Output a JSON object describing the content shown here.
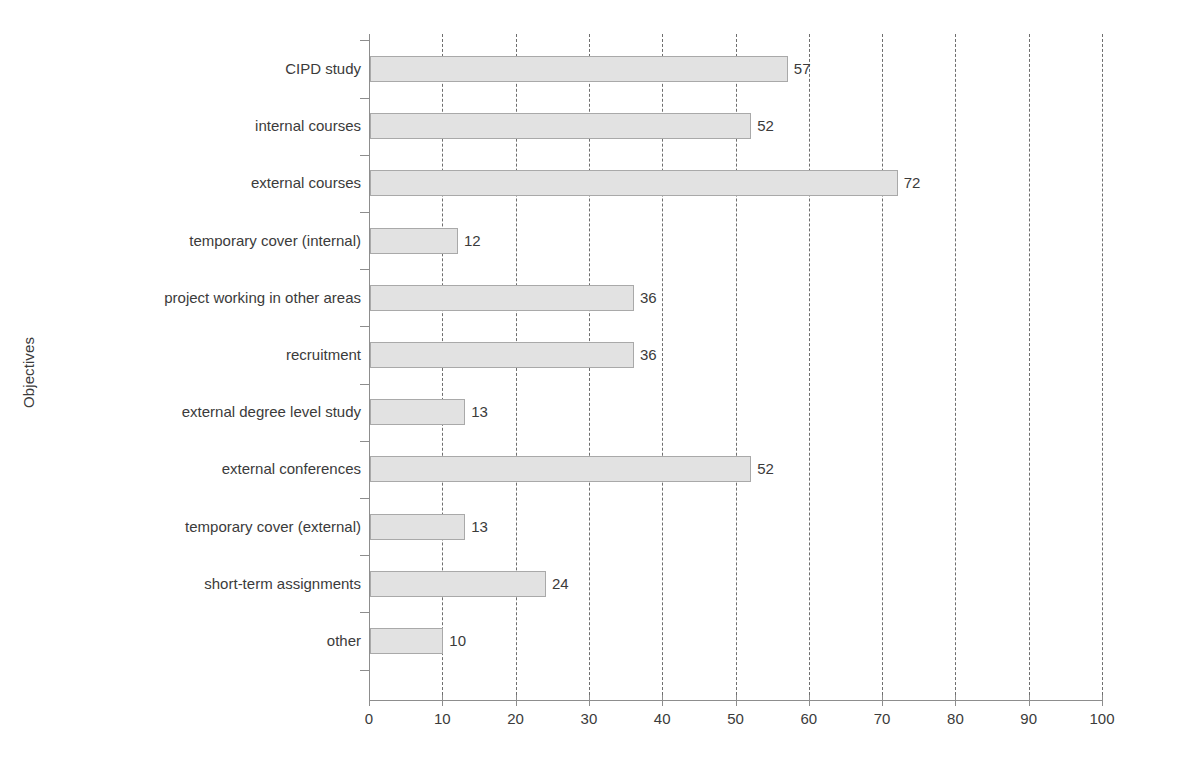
{
  "chart_data": {
    "type": "bar",
    "orientation": "horizontal",
    "title": "",
    "xlabel": "",
    "ylabel": "Objectives",
    "categories": [
      "CIPD study",
      "internal courses",
      "external courses",
      "temporary cover (internal)",
      "project working in other areas",
      "recruitment",
      "external degree level study",
      "external conferences",
      "temporary cover (external)",
      "short-term assignments",
      "other"
    ],
    "values": [
      57,
      52,
      72,
      12,
      36,
      36,
      13,
      52,
      13,
      24,
      10
    ],
    "xlim": [
      0,
      100
    ],
    "xticks": [
      0,
      10,
      20,
      30,
      40,
      50,
      60,
      70,
      80,
      90,
      100
    ],
    "xticklabels": [
      "0",
      "10",
      "20",
      "30",
      "40",
      "50",
      "60",
      "70",
      "80",
      "90",
      "100"
    ],
    "grid": "vertical-dashed",
    "legend": "none",
    "bar_fill_color": "#e2e2e2",
    "bar_border_color": "#a9a9a9",
    "axis_color": "#8d8d8d",
    "text_color": "#3b3b3b",
    "gridline_color": "#6e6e6e",
    "background_color": "#ffffff",
    "data_labels": [
      "57",
      "52",
      "72",
      "12",
      "36",
      "36",
      "13",
      "52",
      "13",
      "24",
      "10"
    ]
  }
}
